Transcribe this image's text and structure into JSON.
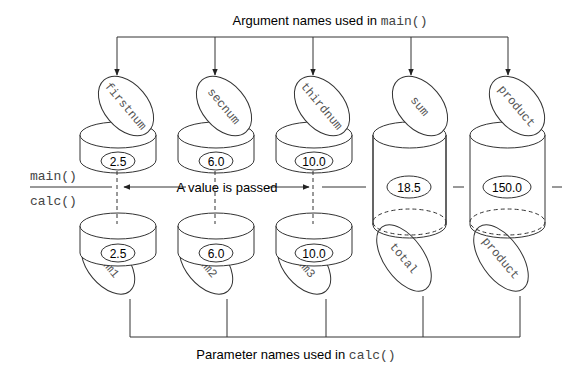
{
  "top_caption": {
    "text": "Argument names used in ",
    "code": "main()"
  },
  "bottom_caption": {
    "text": "Parameter names used in ",
    "code": "calc()"
  },
  "scope_labels": {
    "upper": "main()",
    "lower": "calc()"
  },
  "passed_label": "A value is passed",
  "arguments": [
    {
      "name": "firstnum",
      "value": "2.5"
    },
    {
      "name": "secnum",
      "value": "6.0"
    },
    {
      "name": "thirdnum",
      "value": "10.0"
    },
    {
      "name": "sum",
      "value": "18.5"
    },
    {
      "name": "product",
      "value": "150.0"
    }
  ],
  "parameters": [
    {
      "name": "num1",
      "value": "2.5"
    },
    {
      "name": "num2",
      "value": "6.0"
    },
    {
      "name": "num3",
      "value": "10.0"
    },
    {
      "name": "total",
      "value": "18.5"
    },
    {
      "name": "product",
      "value": "150.0"
    }
  ]
}
